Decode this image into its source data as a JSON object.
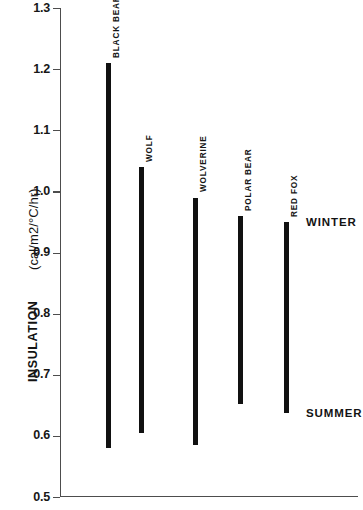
{
  "chart_data": {
    "type": "bar",
    "orientation": "vertical-range",
    "title": "",
    "xlabel": "",
    "ylabel": "INSULATION (cal/m2/°C/hr)",
    "ylabel_main": "INSULATION",
    "ylabel_units": "(cal/m2/°C/hr)",
    "ylim": [
      0.5,
      1.3
    ],
    "ytick_labels": [
      "1.3",
      "1.2",
      "1.1",
      "1.0",
      "0.9",
      "0.8",
      "0.7",
      "0.6",
      "0.5"
    ],
    "ytick_values": [
      1.3,
      1.2,
      1.1,
      1.0,
      0.9,
      0.8,
      0.7,
      0.6,
      0.5
    ],
    "grid": false,
    "legend": "none",
    "categories": [
      "BLACK BEAR",
      "WOLF",
      "WOLVERINE",
      "POLAR BEAR",
      "RED FOX"
    ],
    "series": [
      {
        "name": "WINTER",
        "values": [
          1.21,
          1.04,
          0.99,
          0.96,
          0.95
        ]
      },
      {
        "name": "SUMMER",
        "values": [
          0.58,
          0.605,
          0.585,
          0.652,
          0.637
        ]
      }
    ],
    "bars": [
      {
        "label": "BLACK BEAR",
        "winter": 1.21,
        "summer": 0.58
      },
      {
        "label": "WOLF",
        "winter": 1.04,
        "summer": 0.605
      },
      {
        "label": "WOLVERINE",
        "winter": 0.99,
        "summer": 0.585
      },
      {
        "label": "POLAR BEAR",
        "winter": 0.96,
        "summer": 0.652
      },
      {
        "label": "RED FOX",
        "winter": 0.95,
        "summer": 0.637
      }
    ],
    "annotations": [
      {
        "text": "WINTER",
        "near_value": 0.95
      },
      {
        "text": "SUMMER",
        "near_value": 0.637
      }
    ],
    "colors": {
      "bar": "#111111",
      "axis": "#4d4d4d",
      "text": "#131313",
      "background": "#ffffff"
    }
  }
}
